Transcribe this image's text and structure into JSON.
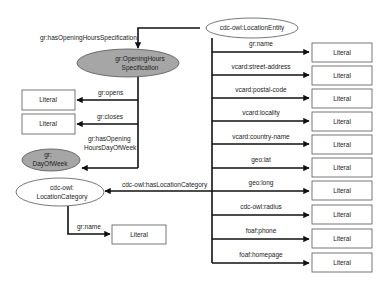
{
  "diagram": {
    "title": "",
    "colors": {
      "white_node": "#ffffff",
      "gray_node": "#a6a6a6",
      "edge": "#111111",
      "border": "#555555"
    },
    "nodes": {
      "location_entity": {
        "label": "cdc-owl:LocationEntity",
        "shape": "ellipse",
        "fill": "white"
      },
      "opening_hours": {
        "label_line1": "gr:OpeningHours",
        "label_line2": "Specification",
        "shape": "ellipse",
        "fill": "gray"
      },
      "day_of_week": {
        "label_line1": "gr:",
        "label_line2": "DayOfWeek",
        "shape": "ellipse",
        "fill": "gray"
      },
      "location_category": {
        "label_line1": "cdc-owl:",
        "label_line2": "LocationCategory",
        "shape": "ellipse",
        "fill": "white"
      },
      "literal_opens": {
        "label": "Literal",
        "shape": "rect"
      },
      "literal_closes": {
        "label": "Literal",
        "shape": "rect"
      },
      "literal_category_name": {
        "label": "Literal",
        "shape": "rect"
      }
    },
    "edges": {
      "has_opening_hours": "gr:hasOpeningHoursSpecification",
      "opens": "gr:opens",
      "closes": "gr:closes",
      "has_opening_day_line1": "gr:hasOpening",
      "has_opening_day_line2": "HoursDayOfWeek",
      "has_location_category": "cdc-owl:hasLocationCategory",
      "category_name": "gr:name"
    },
    "entity_properties": [
      {
        "property": "gr:name",
        "target": "Literal"
      },
      {
        "property": "vcard:street-address",
        "target": "Literal"
      },
      {
        "property": "vcard:postal-code",
        "target": "Literal"
      },
      {
        "property": "vcard:locality",
        "target": "Literal"
      },
      {
        "property": "vcard:country-name",
        "target": "Literal"
      },
      {
        "property": "geo:lat",
        "target": "Literal"
      },
      {
        "property": "geo:long",
        "target": "Literal"
      },
      {
        "property": "cdc-owl:radius",
        "target": "Literal"
      },
      {
        "property": "foaf:phone",
        "target": "Literal"
      },
      {
        "property": "foaf:homepage",
        "target": "Literal"
      }
    ]
  }
}
